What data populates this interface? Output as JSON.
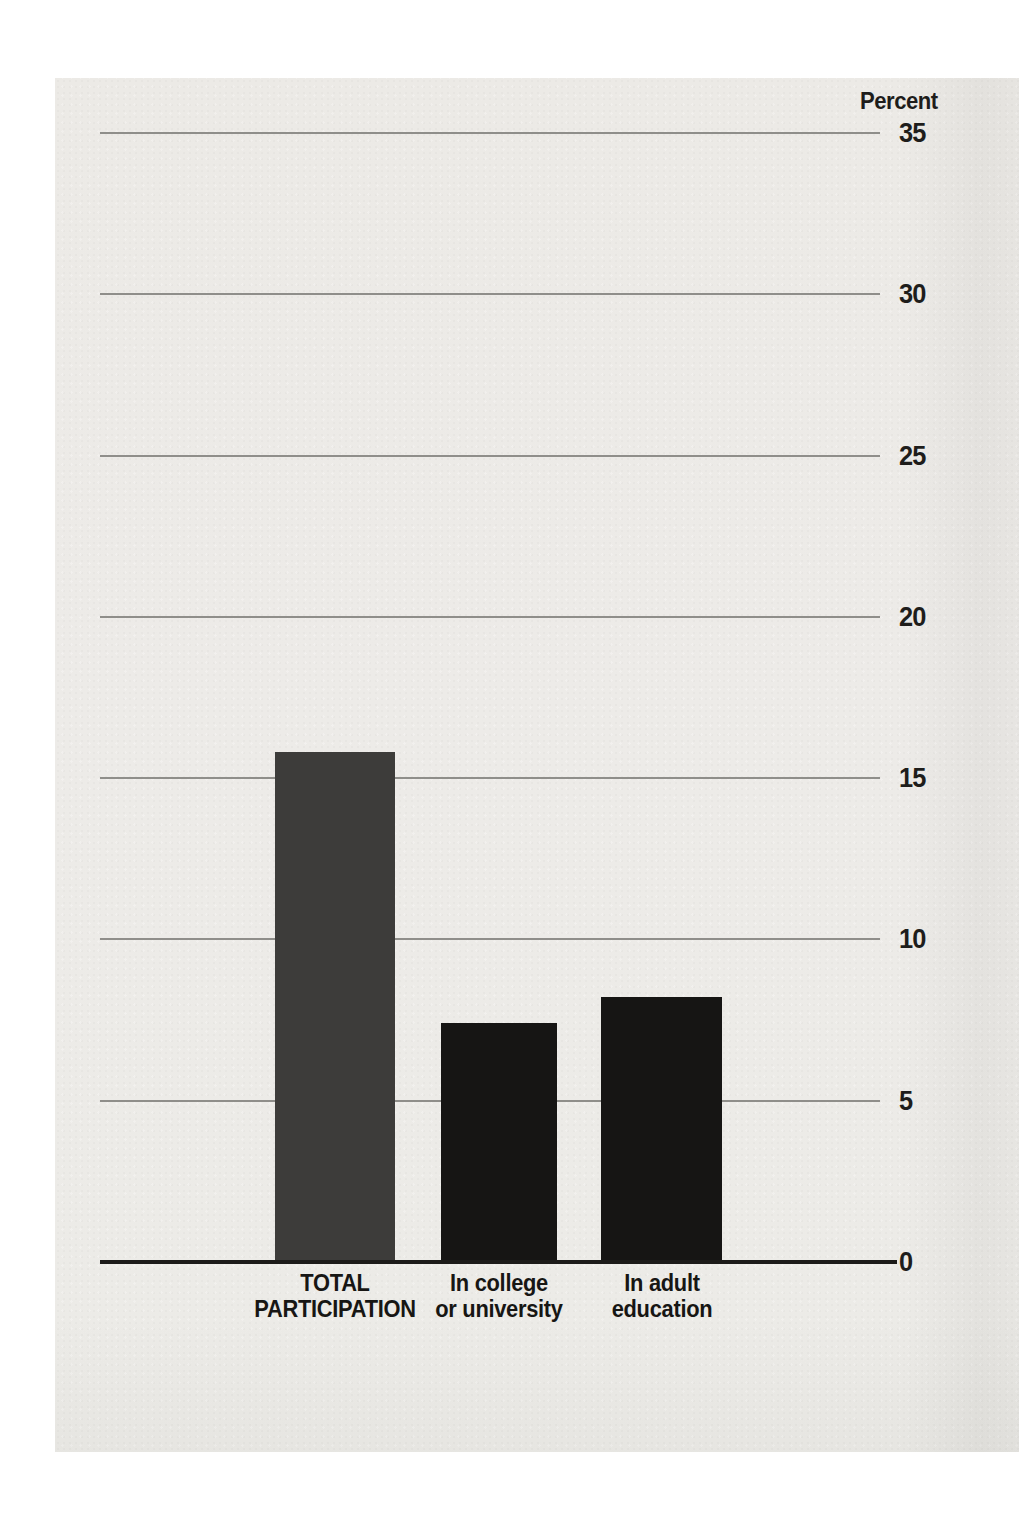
{
  "document": {
    "kind": "scanned report page with statistical chart"
  },
  "chart_data": {
    "type": "bar",
    "title": "",
    "y_axis_title": "Percent",
    "categories": [
      "TOTAL PARTICIPATION",
      "In college or university",
      "In adult education"
    ],
    "category_label_lines": [
      [
        "TOTAL",
        "PARTICIPATION"
      ],
      [
        "In college",
        "or university"
      ],
      [
        "In adult",
        "education"
      ]
    ],
    "values": [
      15.8,
      7.4,
      8.2
    ],
    "yticks": [
      0,
      5,
      10,
      15,
      20,
      25,
      30,
      35
    ],
    "ylim": [
      0,
      35
    ],
    "grid": true,
    "legend": "none",
    "bar_colors": [
      "#3d3c3a",
      "#161514",
      "#161514"
    ],
    "gridline_color": "#8f8e8a",
    "axis_color": "#1c1b19",
    "text_color": "#1e1d1b",
    "paper_color": "#eceae6"
  }
}
